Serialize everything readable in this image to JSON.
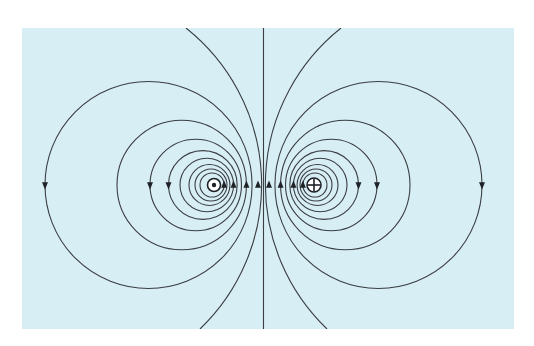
{
  "figure": {
    "background_color": "#d7eef5",
    "line_color": "#3a3d42",
    "panel": {
      "x": 22,
      "y": 28,
      "width": 492,
      "height": 301
    }
  },
  "wires": [
    {
      "id": "left",
      "symbol": "dot",
      "meaning": "current out of page",
      "x": 214,
      "y": 185
    },
    {
      "id": "right",
      "symbol": "cross",
      "meaning": "current into page",
      "x": 314,
      "y": 185
    }
  ],
  "field_lines": {
    "midline_x": 263.5,
    "axis_y": 185,
    "half_separation": 50,
    "loop_outer_distances": [
      218.5,
      146.5,
      113.5,
      95,
      83.5,
      74.5,
      68.5,
      63.5
    ],
    "arrow_direction_left_loops": "counterclockwise (down on far side, up between wires)",
    "arrow_direction_right_loops": "clockwise (up between wires, down on far side)"
  }
}
